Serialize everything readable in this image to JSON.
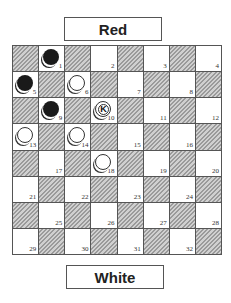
{
  "labels": {
    "top": "Red",
    "bottom": "White"
  },
  "board": {
    "size": 8,
    "top_left_dark": true,
    "squares": [
      {
        "n": 1,
        "piece": "black",
        "king": false
      },
      {
        "n": 2,
        "piece": null,
        "king": false
      },
      {
        "n": 3,
        "piece": null,
        "king": false
      },
      {
        "n": 4,
        "piece": null,
        "king": false
      },
      {
        "n": 5,
        "piece": "black",
        "king": false
      },
      {
        "n": 6,
        "piece": "white",
        "king": false
      },
      {
        "n": 7,
        "piece": null,
        "king": false
      },
      {
        "n": 8,
        "piece": null,
        "king": false
      },
      {
        "n": 9,
        "piece": "black",
        "king": false
      },
      {
        "n": 10,
        "piece": "white",
        "king": true,
        "king_label": "K"
      },
      {
        "n": 11,
        "piece": null,
        "king": false
      },
      {
        "n": 12,
        "piece": null,
        "king": false
      },
      {
        "n": 13,
        "piece": "white",
        "king": false
      },
      {
        "n": 14,
        "piece": "white",
        "king": false
      },
      {
        "n": 15,
        "piece": null,
        "king": false
      },
      {
        "n": 16,
        "piece": null,
        "king": false
      },
      {
        "n": 17,
        "piece": null,
        "king": false
      },
      {
        "n": 18,
        "piece": "white",
        "king": false
      },
      {
        "n": 19,
        "piece": null,
        "king": false
      },
      {
        "n": 20,
        "piece": null,
        "king": false
      },
      {
        "n": 21,
        "piece": null,
        "king": false
      },
      {
        "n": 22,
        "piece": null,
        "king": false
      },
      {
        "n": 23,
        "piece": null,
        "king": false
      },
      {
        "n": 24,
        "piece": null,
        "king": false
      },
      {
        "n": 25,
        "piece": null,
        "king": false
      },
      {
        "n": 26,
        "piece": null,
        "king": false
      },
      {
        "n": 27,
        "piece": null,
        "king": false
      },
      {
        "n": 28,
        "piece": null,
        "king": false
      },
      {
        "n": 29,
        "piece": null,
        "king": false
      },
      {
        "n": 30,
        "piece": null,
        "king": false
      },
      {
        "n": 31,
        "piece": null,
        "king": false
      },
      {
        "n": 32,
        "piece": null,
        "king": false
      }
    ]
  }
}
